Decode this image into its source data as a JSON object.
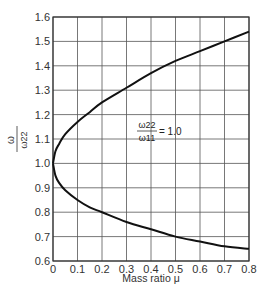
{
  "chart_data": {
    "type": "line",
    "title": "",
    "xlabel": "Mass ratio μ",
    "ylabel": "ω / ω22",
    "xlim": [
      0,
      0.8
    ],
    "ylim": [
      0.6,
      1.6
    ],
    "grid": true,
    "legend": null,
    "x_ticks": [
      "0",
      "0.1",
      "0.2",
      "0.3",
      "0.4",
      "0.5",
      "0.6",
      "0.7",
      "0.8"
    ],
    "y_ticks": [
      "0.6",
      "0.7",
      "0.8",
      "0.9",
      "1.0",
      "1.1",
      "1.2",
      "1.3",
      "1.4",
      "1.5",
      "1.6"
    ],
    "x": [
      0,
      0.01,
      0.025,
      0.05,
      0.1,
      0.15,
      0.2,
      0.3,
      0.4,
      0.5,
      0.6,
      0.7,
      0.8
    ],
    "series": [
      {
        "name": "upper branch",
        "values": [
          1.0,
          1.05,
          1.08,
          1.12,
          1.17,
          1.21,
          1.25,
          1.31,
          1.37,
          1.42,
          1.46,
          1.5,
          1.54
        ]
      },
      {
        "name": "lower branch",
        "values": [
          1.0,
          0.95,
          0.92,
          0.89,
          0.85,
          0.82,
          0.8,
          0.76,
          0.73,
          0.7,
          0.68,
          0.66,
          0.65
        ]
      }
    ],
    "annotations": [
      {
        "text": "ω22 / ω11 = 1.0",
        "numerator": "ω22",
        "denominator": "ω11",
        "value": "1.0",
        "x": 0.38,
        "y": 1.14
      }
    ]
  },
  "axes": {
    "y_label_numerator": "ω",
    "y_label_denominator": "ω22",
    "x_label": "Mass ratio μ"
  },
  "annotation": {
    "numerator": "ω22",
    "denominator": "ω11",
    "equals": "= 1.0"
  }
}
